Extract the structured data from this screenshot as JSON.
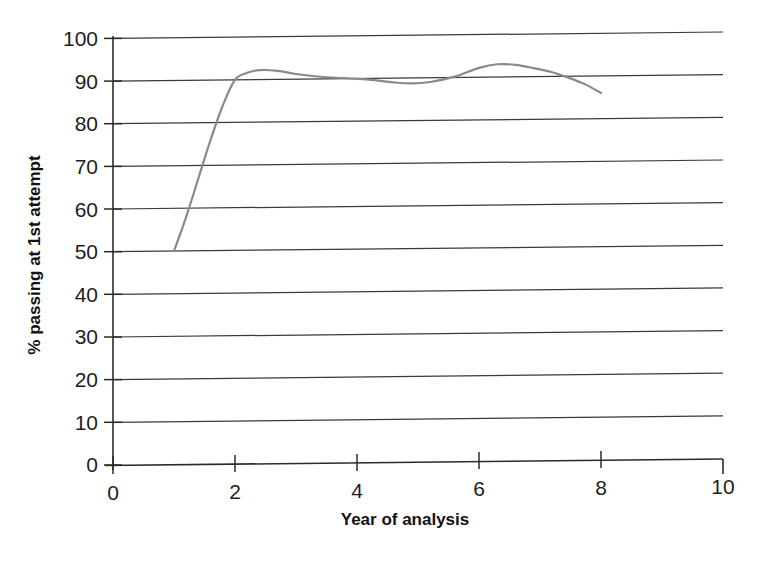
{
  "chart_data": {
    "type": "line",
    "title": "",
    "xlabel": "Year of analysis",
    "ylabel": "% passing at 1st attempt",
    "xlim": [
      0,
      10
    ],
    "ylim": [
      0,
      100
    ],
    "xticks": [
      0,
      2,
      4,
      6,
      8,
      10
    ],
    "xtick_labels": [
      "0",
      "2",
      "4",
      "6",
      "8",
      "10"
    ],
    "yticks": [
      0,
      10,
      20,
      30,
      40,
      50,
      60,
      70,
      80,
      90,
      100
    ],
    "ytick_labels": [
      "0",
      "10",
      "20",
      "30",
      "40",
      "50",
      "60",
      "70",
      "80",
      "90",
      "100"
    ],
    "grid": "horizontal",
    "legend": "none",
    "series": [
      {
        "name": "% passing at 1st attempt",
        "color": "#8a8a8a",
        "x": [
          1,
          2,
          3,
          4,
          5,
          6,
          7,
          8
        ],
        "values": [
          50,
          90,
          91,
          90,
          89,
          91,
          92,
          86
        ],
        "curve_points": [
          [
            1.0,
            50.0
          ],
          [
            1.2,
            58.0
          ],
          [
            1.4,
            67.0
          ],
          [
            1.6,
            76.0
          ],
          [
            1.8,
            84.0
          ],
          [
            2.0,
            90.0
          ],
          [
            2.2,
            91.6
          ],
          [
            2.4,
            92.2
          ],
          [
            2.7,
            92.0
          ],
          [
            3.0,
            91.2
          ],
          [
            3.4,
            90.5
          ],
          [
            3.8,
            90.1
          ],
          [
            4.2,
            89.7
          ],
          [
            4.6,
            89.0
          ],
          [
            4.9,
            88.7
          ],
          [
            5.2,
            89.0
          ],
          [
            5.6,
            90.2
          ],
          [
            6.0,
            92.2
          ],
          [
            6.3,
            93.0
          ],
          [
            6.6,
            92.8
          ],
          [
            6.9,
            92.0
          ],
          [
            7.2,
            91.0
          ],
          [
            7.5,
            89.5
          ],
          [
            7.75,
            88.0
          ],
          [
            8.0,
            86.0
          ]
        ]
      }
    ],
    "axis_tick_labels_y": {
      "100": "100",
      "90": "90",
      "80": "80",
      "70": "70",
      "60": "60",
      "50": "50",
      "40": "40",
      "30": "30",
      "20": "20",
      "10": "10",
      "0": "0"
    },
    "colors": {
      "line": "#8a8a8a",
      "grid": "#3a3a3a",
      "axis": "#2b2b2b",
      "text": "#1d1d1d",
      "background": "#ffffff"
    }
  },
  "labels": {
    "y_axis_title": "% passing at 1st attempt",
    "x_axis_title": "Year of analysis",
    "y_100": "100",
    "y_90": "90",
    "y_80": "80",
    "y_70": "70",
    "y_60": "60",
    "y_50": "50",
    "y_40": "40",
    "y_30": "30",
    "y_20": "20",
    "y_10": "10",
    "y_0": "0",
    "x_0": "0",
    "x_2": "2",
    "x_4": "4",
    "x_6": "6",
    "x_8": "8",
    "x_10": "10"
  }
}
